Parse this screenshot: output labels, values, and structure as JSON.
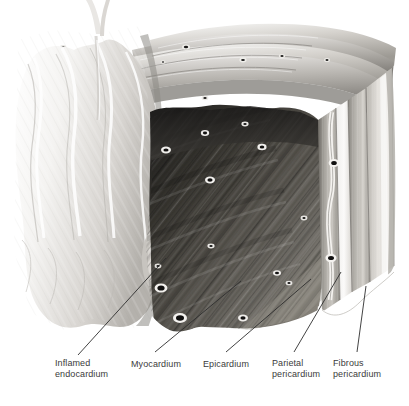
{
  "figure": {
    "type": "medical-illustration",
    "background_color": "#ffffff",
    "label_color": "#3b3b3b",
    "leader_line_color": "#2e2e2e",
    "palette": {
      "endocardium_light": "#f2f1ef",
      "endocardium_shadow": "#b9b6b2",
      "myocardium_dark": "#4a4845",
      "myocardium_deep": "#2a2927",
      "epicardium_mid": "#8e8b86",
      "pericardium_band": "#b0ada8",
      "fibrous_band": "#d6d3ce",
      "vessel_ring": "#efeeeb",
      "vessel_core": "#171615"
    }
  },
  "labels": [
    {
      "id": "inflamed-endocardium",
      "text": "Inflamed\nendocardium",
      "x": 55,
      "y": 358,
      "leader": {
        "x1": 78,
        "y1": 355,
        "x2": 166,
        "y2": 258
      }
    },
    {
      "id": "myocardium",
      "text": "Myocardium",
      "x": 131,
      "y": 359,
      "leader": {
        "x1": 155,
        "y1": 352,
        "x2": 241,
        "y2": 281
      }
    },
    {
      "id": "epicardium",
      "text": "Epicardium",
      "x": 203,
      "y": 359,
      "leader": {
        "x1": 226,
        "y1": 352,
        "x2": 311,
        "y2": 279
      }
    },
    {
      "id": "parietal-pericardium",
      "text": "Parietal\npericardium",
      "x": 272,
      "y": 358,
      "leader": {
        "x1": 294,
        "y1": 352,
        "x2": 341,
        "y2": 272
      }
    },
    {
      "id": "fibrous-pericardium",
      "text": "Fibrous\npericardium",
      "x": 333,
      "y": 358,
      "leader": {
        "x1": 357,
        "y1": 352,
        "x2": 366,
        "y2": 286
      }
    }
  ],
  "anatomy_regions": [
    {
      "name": "inflamed-endocardium",
      "description": "Pale ridged trabeculated inner surface, upper-left"
    },
    {
      "name": "myocardium",
      "description": "Dark striated muscle mass with diagonal fiber bundles and vessel cross-sections"
    },
    {
      "name": "epicardium",
      "description": "Narrow mid-grey band right of myocardium"
    },
    {
      "name": "pericardial-space",
      "description": "Thin pale gap between epicardium and parietal pericardium"
    },
    {
      "name": "parietal-pericardium",
      "description": "Grey vertical band near right edge"
    },
    {
      "name": "fibrous-pericardium",
      "description": "Outermost light band at right edge"
    },
    {
      "name": "chordae-strand",
      "description": "Thin pale strand rising from endocardial surface at top"
    },
    {
      "name": "coronary-vessels",
      "description": "Small white-rimmed dark oval vessel lumens scattered in myocardium"
    }
  ]
}
